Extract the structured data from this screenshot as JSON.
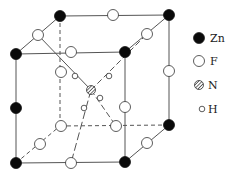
{
  "diagram": {
    "type": "crystal-structure",
    "colors": {
      "line": "#555555",
      "zn_fill": "#0a0a0a",
      "f_fill": "#ffffff",
      "n_fill": "#888888",
      "h_fill": "#ffffff",
      "stroke": "#333333"
    },
    "zn": [
      {
        "x": 60,
        "y": 16
      },
      {
        "x": 169,
        "y": 15
      },
      {
        "x": 16,
        "y": 54
      },
      {
        "x": 125,
        "y": 52
      },
      {
        "x": 16,
        "y": 108
      },
      {
        "x": 16,
        "y": 163
      },
      {
        "x": 125,
        "y": 162
      },
      {
        "x": 169,
        "y": 125
      }
    ],
    "f": [
      {
        "x": 113,
        "y": 15
      },
      {
        "x": 38,
        "y": 35
      },
      {
        "x": 147,
        "y": 34
      },
      {
        "x": 71,
        "y": 52
      },
      {
        "x": 61,
        "y": 72
      },
      {
        "x": 169,
        "y": 71
      },
      {
        "x": 125,
        "y": 107
      },
      {
        "x": 61,
        "y": 126
      },
      {
        "x": 116,
        "y": 126
      },
      {
        "x": 40,
        "y": 144
      },
      {
        "x": 147,
        "y": 143
      },
      {
        "x": 71,
        "y": 163
      }
    ],
    "n": {
      "x": 91,
      "y": 90
    },
    "h": [
      {
        "x": 75,
        "y": 76
      },
      {
        "x": 109,
        "y": 76
      },
      {
        "x": 100,
        "y": 98
      },
      {
        "x": 84,
        "y": 108
      }
    ]
  },
  "legend": {
    "items": [
      {
        "symbol": "filled-circle",
        "label": "Zn"
      },
      {
        "symbol": "open-circle",
        "label": "F"
      },
      {
        "symbol": "hatched-circle",
        "label": "N"
      },
      {
        "symbol": "small-open-circle",
        "label": "H"
      }
    ]
  }
}
